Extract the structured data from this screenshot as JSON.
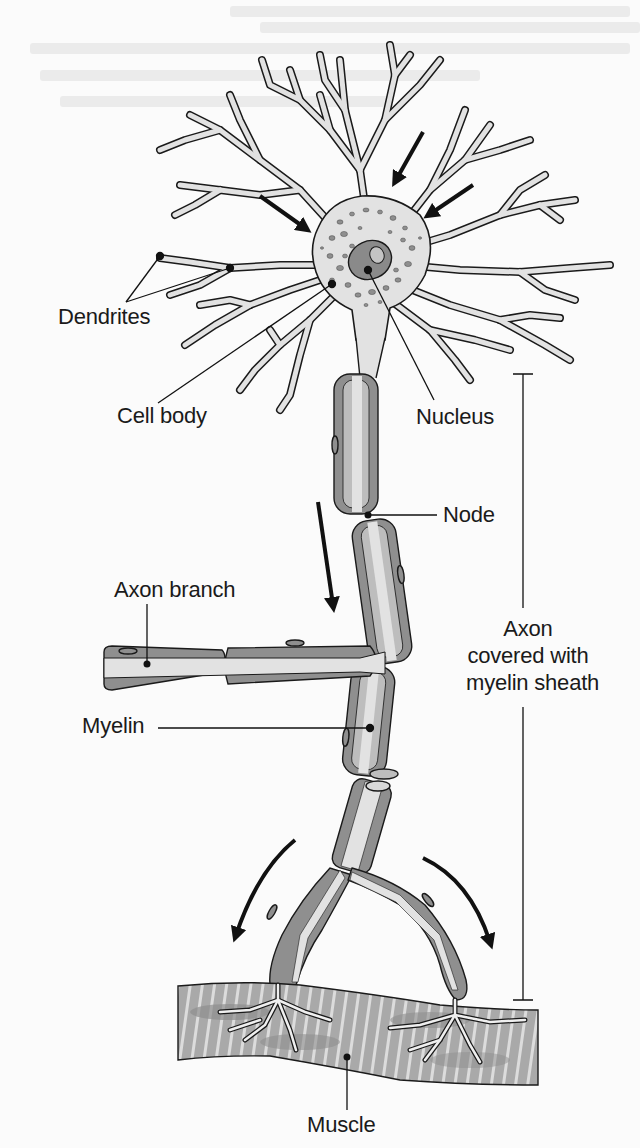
{
  "figure": {
    "colors": {
      "background": "#fbfbfb",
      "outline": "#1a1a1a",
      "cytoplasm": "#e2e2e2",
      "myelin": "#8f8f8f",
      "myelin_light": "#bdbdbd",
      "nucleus": "#8a8a8a",
      "nucleolus": "#c4c4c4",
      "muscle": "#a9a9a9",
      "muscle_stripe": "#dcdcdc",
      "arrow": "#111111"
    }
  },
  "labels": {
    "dendrites": "Dendrites",
    "cell_body": "Cell body",
    "nucleus": "Nucleus",
    "node": "Node",
    "axon_branch": "Axon branch",
    "myelin": "Myelin",
    "axon_line1": "Axon",
    "axon_line2": "covered with",
    "axon_line3": "myelin sheath",
    "muscle": "Muscle"
  },
  "arrows": {
    "signal_direction": "toward cell body from dendrites, then down the axon to muscle",
    "count": 6
  }
}
